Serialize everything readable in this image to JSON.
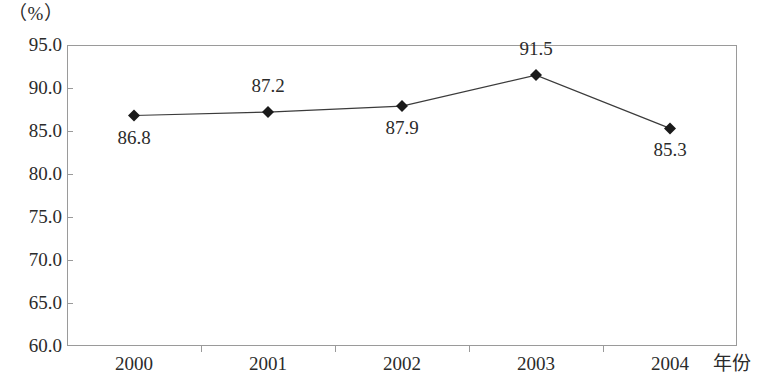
{
  "chart_data": {
    "type": "line",
    "title": "",
    "subtitle": "",
    "xlabel": "年份",
    "ylabel": "（%）",
    "categories": [
      "2000",
      "2001",
      "2002",
      "2003",
      "2004"
    ],
    "values": [
      86.8,
      87.2,
      87.9,
      91.5,
      85.3
    ],
    "series": [
      {
        "name": "",
        "values": [
          86.8,
          87.2,
          87.9,
          91.5,
          85.3
        ]
      }
    ],
    "point_labels": [
      "86.8",
      "87.2",
      "87.9",
      "91.5",
      "85.3"
    ],
    "point_label_positions": [
      "below",
      "above",
      "below",
      "above",
      "below"
    ],
    "ylim": [
      60.0,
      95.0
    ],
    "ytick_values": [
      95.0,
      90.0,
      85.0,
      80.0,
      75.0,
      70.0,
      65.0,
      60.0
    ],
    "ytick_labels": [
      "95.0",
      "90.0",
      "85.0",
      "80.0",
      "75.0",
      "70.0",
      "65.0",
      "60.0"
    ],
    "xtick_labels": [
      "2000",
      "2001",
      "2002",
      "2003",
      "2004"
    ],
    "grid": false,
    "legend": "none",
    "marker": "diamond",
    "colors": {
      "line": "#3b3b3b",
      "marker": "#1a1a1a",
      "frame": "#9a9a9a",
      "text": "#2b2b2b",
      "background": "#ffffff"
    }
  }
}
